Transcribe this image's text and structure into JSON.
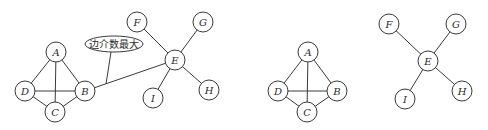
{
  "figure": {
    "node_radius": 10,
    "stroke_color": "#3a3a3a",
    "panels": [
      {
        "name": "before",
        "nodes": [
          {
            "id": "A",
            "label": "A",
            "x": 56,
            "y": 52
          },
          {
            "id": "B",
            "label": "B",
            "x": 85,
            "y": 91
          },
          {
            "id": "C",
            "label": "C",
            "x": 55,
            "y": 112
          },
          {
            "id": "D",
            "label": "D",
            "x": 25,
            "y": 91
          },
          {
            "id": "E",
            "label": "E",
            "x": 175,
            "y": 60
          },
          {
            "id": "F",
            "label": "F",
            "x": 137,
            "y": 22
          },
          {
            "id": "G",
            "label": "G",
            "x": 203,
            "y": 22
          },
          {
            "id": "H",
            "label": "H",
            "x": 209,
            "y": 90
          },
          {
            "id": "I",
            "label": "I",
            "x": 153,
            "y": 98
          }
        ],
        "edges": [
          [
            "A",
            "D"
          ],
          [
            "A",
            "B"
          ],
          [
            "A",
            "C"
          ],
          [
            "D",
            "B"
          ],
          [
            "D",
            "C"
          ],
          [
            "C",
            "B"
          ],
          [
            "B",
            "E"
          ],
          [
            "E",
            "F"
          ],
          [
            "E",
            "G"
          ],
          [
            "E",
            "H"
          ],
          [
            "E",
            "I"
          ]
        ],
        "callout": {
          "text": "边介数最大",
          "ellipse": {
            "cx": 114,
            "cy": 44,
            "rx": 29,
            "ry": 8
          },
          "pointer": {
            "x1": 111,
            "y1": 52,
            "x2": 106,
            "y2": 84
          }
        }
      },
      {
        "name": "after",
        "nodes": [
          {
            "id": "A",
            "label": "A",
            "x": 308,
            "y": 52
          },
          {
            "id": "B",
            "label": "B",
            "x": 337,
            "y": 91
          },
          {
            "id": "C",
            "label": "C",
            "x": 307,
            "y": 112
          },
          {
            "id": "D",
            "label": "D",
            "x": 278,
            "y": 91
          },
          {
            "id": "E",
            "label": "E",
            "x": 428,
            "y": 61
          },
          {
            "id": "F",
            "label": "F",
            "x": 389,
            "y": 24
          },
          {
            "id": "G",
            "label": "G",
            "x": 456,
            "y": 24
          },
          {
            "id": "H",
            "label": "H",
            "x": 462,
            "y": 91
          },
          {
            "id": "I",
            "label": "I",
            "x": 405,
            "y": 99
          }
        ],
        "edges": [
          [
            "A",
            "D"
          ],
          [
            "A",
            "B"
          ],
          [
            "A",
            "C"
          ],
          [
            "D",
            "B"
          ],
          [
            "D",
            "C"
          ],
          [
            "C",
            "B"
          ],
          [
            "E",
            "F"
          ],
          [
            "E",
            "G"
          ],
          [
            "E",
            "H"
          ],
          [
            "E",
            "I"
          ]
        ]
      }
    ]
  }
}
